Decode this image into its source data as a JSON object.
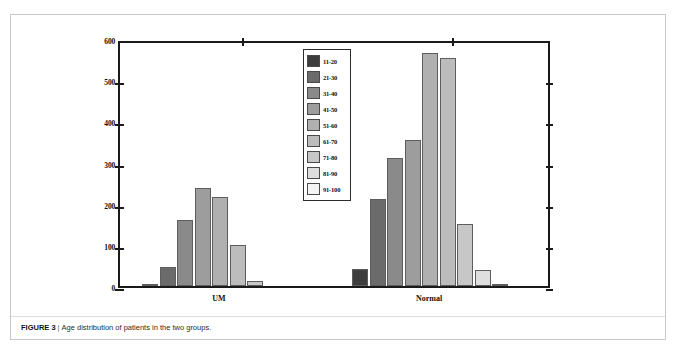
{
  "figure": {
    "caption_label": "FIGURE 3",
    "caption_separator": "|",
    "caption_text": "Age distribution of patients in the two groups."
  },
  "chart_data": {
    "type": "bar",
    "title": "",
    "xlabel": "",
    "ylabel": "",
    "categories": [
      "UM",
      "Normal"
    ],
    "ylim": [
      0,
      600
    ],
    "yticks": [
      0,
      100,
      200,
      300,
      400,
      500,
      600
    ],
    "ytick_labels": [
      "0",
      "100",
      "200",
      "300",
      "400",
      "500",
      "600"
    ],
    "grid": false,
    "legend_position": "center-left-inside",
    "legend_title": "",
    "series": [
      {
        "name": "11-20",
        "color": "#3d3d3d",
        "values": [
          5,
          42
        ]
      },
      {
        "name": "21-30",
        "color": "#6b6b6b",
        "values": [
          45,
          212
        ]
      },
      {
        "name": "31-40",
        "color": "#8a8a8a",
        "values": [
          160,
          310
        ]
      },
      {
        "name": "41-50",
        "color": "#9d9d9d",
        "values": [
          237,
          355
        ]
      },
      {
        "name": "51-60",
        "color": "#b0b0b0",
        "values": [
          217,
          565
        ]
      },
      {
        "name": "61-70",
        "color": "#bcbcbc",
        "values": [
          100,
          553
        ]
      },
      {
        "name": "71-80",
        "color": "#c7c7c7",
        "values": [
          13,
          150
        ]
      },
      {
        "name": "81-90",
        "color": "#dedede",
        "values": [
          0,
          40
        ]
      },
      {
        "name": "91-100",
        "color": "#f4f4f4",
        "values": [
          0,
          3
        ]
      }
    ]
  },
  "colors": {
    "axis": "#1a1a1a",
    "bar_border": "#5d5d5d",
    "frame": "#c9c9c9",
    "caption_text": "#2b2b2b"
  }
}
